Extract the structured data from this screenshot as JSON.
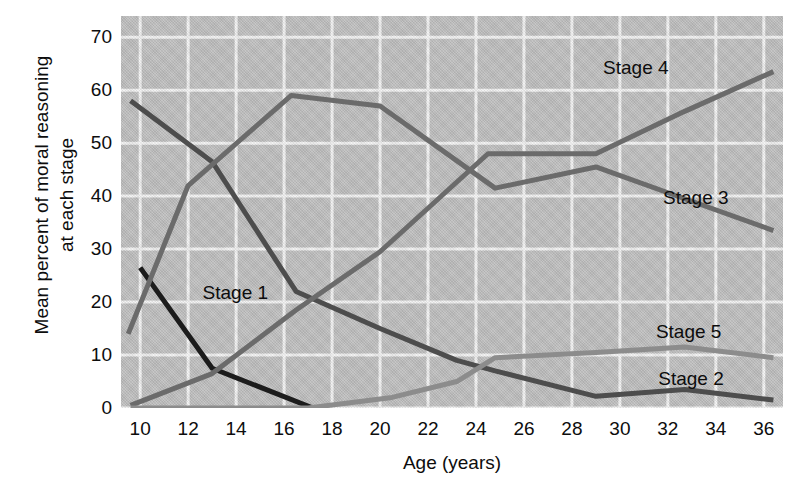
{
  "chart_data": {
    "type": "line",
    "title": "",
    "xlabel": "Age (years)",
    "ylabel": "Mean percent of moral reasoning\nat each stage",
    "xlim": [
      9.2,
      36.8
    ],
    "ylim": [
      0,
      74
    ],
    "xticks": [
      10,
      12,
      14,
      16,
      18,
      20,
      22,
      24,
      26,
      28,
      30,
      32,
      34,
      36
    ],
    "yticks": [
      0,
      10,
      20,
      30,
      40,
      50,
      60,
      70
    ],
    "grid": true,
    "legend_position": "inline-annotations",
    "plot_background": "#bfbfbf",
    "gridline_color": "#f2f2f2",
    "series": [
      {
        "name": "Stage 1",
        "color": "#1c1c1c",
        "label_x": 12.6,
        "label_y": 21.5,
        "x": [
          10.0,
          13.0,
          17.2
        ],
        "y": [
          26.5,
          7.5,
          0.0
        ]
      },
      {
        "name": "Stage 2",
        "color": "#4d4d4d",
        "label_x": 31.6,
        "label_y": 5.3,
        "x": [
          9.6,
          13.0,
          16.5,
          20.0,
          23.2,
          24.8,
          29.0,
          32.7,
          36.4
        ],
        "y": [
          58.0,
          46.5,
          22.0,
          15.0,
          9.0,
          7.0,
          2.2,
          3.5,
          1.5
        ]
      },
      {
        "name": "Stage 3",
        "color": "#6b6b6b",
        "label_x": 31.8,
        "label_y": 39.5,
        "x": [
          9.5,
          12.0,
          16.3,
          20.0,
          24.8,
          29.0,
          32.7,
          36.4
        ],
        "y": [
          14.0,
          42.0,
          59.0,
          57.0,
          41.5,
          45.5,
          39.5,
          33.5
        ]
      },
      {
        "name": "Stage 4",
        "color": "#6b6b6b",
        "label_x": 29.3,
        "label_y": 64.0,
        "x": [
          9.6,
          13.0,
          16.5,
          20.0,
          24.5,
          26.0,
          29.0,
          32.7,
          36.4
        ],
        "y": [
          0.5,
          6.5,
          18.5,
          29.5,
          48.0,
          48.0,
          48.0,
          56.0,
          63.5
        ]
      },
      {
        "name": "Stage 5",
        "color": "#8c8c8c",
        "label_x": 31.5,
        "label_y": 14.2,
        "x": [
          9.6,
          17.0,
          20.5,
          23.2,
          24.8,
          29.0,
          32.7,
          36.4
        ],
        "y": [
          0.0,
          0.0,
          2.0,
          5.0,
          9.5,
          10.5,
          11.5,
          9.5
        ]
      }
    ]
  }
}
